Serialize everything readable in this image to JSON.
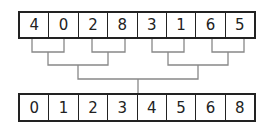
{
  "diagram": {
    "type": "merge-sort-tree",
    "input_array": [
      "4",
      "0",
      "2",
      "8",
      "3",
      "1",
      "6",
      "5"
    ],
    "output_array": [
      "0",
      "1",
      "2",
      "3",
      "4",
      "5",
      "6",
      "8"
    ],
    "line_color": "#888888",
    "box_color": "#222222"
  }
}
